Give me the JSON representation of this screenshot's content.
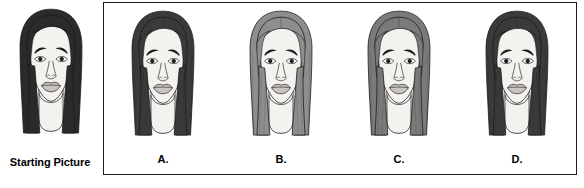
{
  "layout": {
    "width": 584,
    "height": 188,
    "background": "#ffffff",
    "box_border_color": "#1b1b1b"
  },
  "starting": {
    "caption": "Starting Picture",
    "face": {
      "id": "starting-picture-face",
      "hair_color": "#2b2b2b",
      "hair_shade": "dark",
      "skin_color": "#f4f2ef",
      "outline_color": "#1a1a1a",
      "lip_color": "#c9c4bf"
    }
  },
  "options": [
    {
      "label": "A.",
      "id": "option-a",
      "face": {
        "hair_color": "#3a3a3a",
        "hair_shade": "dark",
        "skin_color": "#f4f2ef",
        "outline_color": "#1a1a1a",
        "lip_color": "#c9c4bf"
      }
    },
    {
      "label": "B.",
      "id": "option-b",
      "face": {
        "hair_color": "#8e8e8e",
        "hair_shade": "light-gray",
        "skin_color": "#f4f2ef",
        "outline_color": "#1a1a1a",
        "lip_color": "#c9c4bf"
      }
    },
    {
      "label": "C.",
      "id": "option-c",
      "face": {
        "hair_color": "#7a7a7a",
        "hair_shade": "medium-gray",
        "skin_color": "#f4f2ef",
        "outline_color": "#1a1a1a",
        "lip_color": "#c9c4bf"
      }
    },
    {
      "label": "D.",
      "id": "option-d",
      "face": {
        "hair_color": "#3a3a3a",
        "hair_shade": "dark",
        "skin_color": "#f4f2ef",
        "outline_color": "#1a1a1a",
        "lip_color": "#c9c4bf"
      }
    }
  ]
}
